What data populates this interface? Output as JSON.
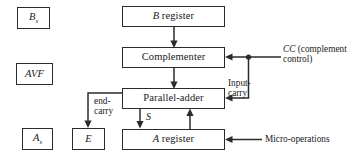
{
  "diagram": {
    "boxes": {
      "bs": {
        "text": "B",
        "subscript": "s",
        "name": "b-sign-box"
      },
      "avf": {
        "text": "AVF",
        "name": "avf-box"
      },
      "as": {
        "text": "A",
        "subscript": "s",
        "name": "a-sign-box"
      },
      "e": {
        "text": "E",
        "name": "e-box"
      },
      "b_register": {
        "italic": "B",
        "rest": "register"
      },
      "complementer": {
        "text": "Complementer"
      },
      "parallel_adder": {
        "text": "Parallel-adder"
      },
      "a_register": {
        "italic": "A",
        "rest": "register"
      }
    },
    "labels": {
      "cc": {
        "italic": "CC",
        "line1_rest": " (complement",
        "line2": "control)"
      },
      "input_carry_line1": "Input-",
      "input_carry_line2": "carry",
      "end_carry_line1": "end-",
      "end_carry_line2": "carry",
      "sum": "S",
      "micro_operations": "Micro-operations"
    },
    "colors": {
      "stroke": "#2b2b2b",
      "text": "#1a1a1a",
      "background": "#ffffff"
    }
  }
}
